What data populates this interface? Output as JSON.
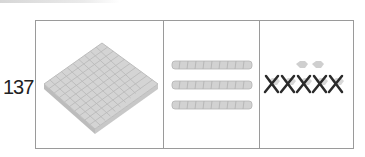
{
  "number_label": "137",
  "place_value_table": {
    "columns": [
      {
        "name": "hundreds",
        "count": 1,
        "representation": "flat-block"
      },
      {
        "name": "tens",
        "count": 3,
        "representation": "rod"
      },
      {
        "name": "ones",
        "count": 7,
        "kept": 2,
        "crossed_out": 5,
        "representation": "unit-cube"
      }
    ]
  },
  "colors": {
    "border": "#9a9a9a",
    "block_fill": "#d4d4d4",
    "block_line": "#b0b0b0",
    "cross_mark": "#2a2a2a"
  }
}
